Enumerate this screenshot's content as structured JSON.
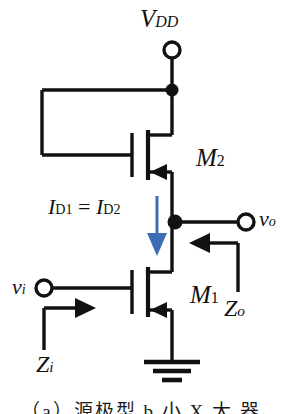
{
  "figure": {
    "type": "circuit-schematic",
    "background_color": "#ffffff",
    "wire_color": "#111111",
    "current_arrow_color": "#3c6cb4",
    "caption": "（a）源极型 b 小 X 大 器"
  },
  "labels": {
    "supply": {
      "base": "V",
      "sub": "DD"
    },
    "transistor_top": {
      "base": "M",
      "sub": "2"
    },
    "transistor_bottom": {
      "base": "M",
      "sub": "1"
    },
    "current_equation": {
      "left_base": "I",
      "left_sub": "D1",
      "operator": "=",
      "right_base": "I",
      "right_sub": "D2"
    },
    "output_voltage": {
      "base": "v",
      "sub": "o"
    },
    "input_voltage": {
      "base": "v",
      "sub": "i"
    },
    "output_impedance": {
      "base": "Z",
      "sub": "o"
    },
    "input_impedance": {
      "base": "Z",
      "sub": "i"
    }
  },
  "nodes": {
    "supply_terminal": {
      "name": "VDD terminal",
      "x": 172,
      "y": 50,
      "style": "open-circle"
    },
    "supply_junction": {
      "name": "VDD junction",
      "x": 172,
      "y": 90,
      "style": "solid-dot"
    },
    "output_junction": {
      "name": "output node",
      "x": 175,
      "y": 222,
      "style": "solid-dot"
    },
    "output_terminal": {
      "name": "vo terminal",
      "x": 246,
      "y": 222,
      "style": "open-circle"
    },
    "input_terminal": {
      "name": "vi terminal",
      "x": 44,
      "y": 288,
      "style": "open-circle"
    },
    "ground": {
      "name": "ground symbol",
      "x": 172,
      "y": 372,
      "style": "earth"
    }
  },
  "devices": [
    {
      "id": "M2",
      "type": "NMOS",
      "role": "diode-connected load",
      "gate_x": 132,
      "channel_x": 148,
      "drain_y": 135,
      "source_y": 172
    },
    {
      "id": "M1",
      "type": "NMOS",
      "role": "driver",
      "gate_x": 132,
      "channel_x": 148,
      "drain_y": 272,
      "source_y": 310
    }
  ],
  "annotations": {
    "current_arrow": {
      "direction": "down",
      "color": "#3c6cb4",
      "x": 157,
      "y_start": 196,
      "y_end": 254
    },
    "zo_arrow": {
      "direction": "left",
      "x_start": 238,
      "x_end": 192,
      "y": 243
    },
    "zi_arrow": {
      "direction": "right",
      "x_start": 44,
      "x_end": 96,
      "y": 308
    }
  }
}
